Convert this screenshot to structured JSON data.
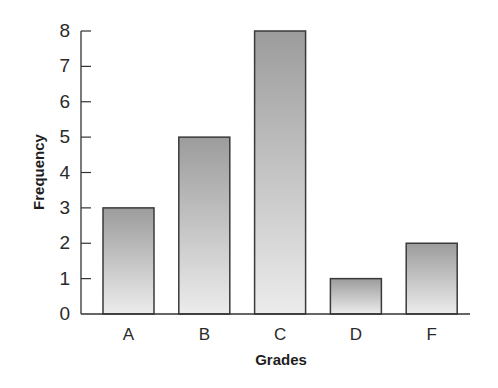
{
  "chart_data": {
    "type": "bar",
    "title": "",
    "xlabel": "Grades",
    "ylabel": "Frequency",
    "categories": [
      "A",
      "B",
      "C",
      "D",
      "F"
    ],
    "values": [
      3,
      5,
      8,
      1,
      2
    ],
    "ylim": [
      0,
      8
    ],
    "yticks": [
      0,
      1,
      2,
      3,
      4,
      5,
      6,
      7,
      8
    ],
    "grid": false,
    "legend": null,
    "bar_style": {
      "fill_top": "#9c9c9c",
      "fill_bottom": "#ececec",
      "border": "#3a3a3a"
    }
  }
}
